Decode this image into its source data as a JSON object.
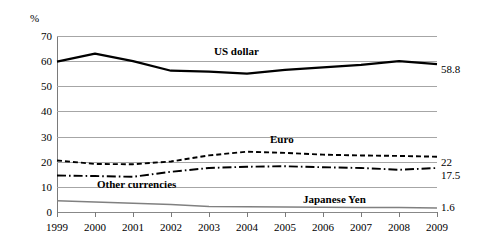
{
  "chart_data": {
    "type": "line",
    "title": "",
    "xlabel": "",
    "ylabel": "%",
    "unit_label": "%",
    "ylim": [
      0,
      70
    ],
    "ytick_step": 10,
    "yticks": [
      70,
      60,
      50,
      40,
      30,
      20,
      10,
      0
    ],
    "grid": true,
    "legend_position": "inline-labels",
    "categories": [
      "1999",
      "2000",
      "2001",
      "2002",
      "2003",
      "2004",
      "2005",
      "2006",
      "2007",
      "2008",
      "2009"
    ],
    "series": [
      {
        "name": "US dollar",
        "style": "solid-thick",
        "color": "#000000",
        "end_label": "58.8",
        "values": [
          59.8,
          63.0,
          60.0,
          56.2,
          55.8,
          55.0,
          56.5,
          57.5,
          58.5,
          60.0,
          58.8
        ]
      },
      {
        "name": "Euro",
        "style": "dashed",
        "color": "#000000",
        "end_label": "22",
        "values": [
          20.5,
          19.1,
          19.0,
          20.1,
          22.5,
          24.0,
          23.5,
          22.8,
          22.5,
          22.3,
          22.0
        ]
      },
      {
        "name": "Other currencies",
        "style": "dash-dot",
        "color": "#000000",
        "end_label": "17.5",
        "values": [
          14.5,
          14.3,
          14.0,
          16.0,
          17.5,
          18.0,
          18.2,
          17.8,
          17.5,
          16.8,
          17.5
        ]
      },
      {
        "name": "Japanese Yen",
        "style": "solid-thin-gray",
        "color": "#808080",
        "end_label": "1.6",
        "values": [
          4.5,
          4.0,
          3.5,
          3.0,
          2.2,
          2.1,
          2.0,
          1.9,
          1.8,
          1.8,
          1.6
        ]
      }
    ]
  },
  "labels": {
    "unit": "%",
    "series_us_dollar": "US dollar",
    "series_euro": "Euro",
    "series_other": "Other currencies",
    "series_yen": "Japanese Yen",
    "end_us_dollar": "58.8",
    "end_euro": "22",
    "end_other": "17.5",
    "end_yen": "1.6"
  }
}
